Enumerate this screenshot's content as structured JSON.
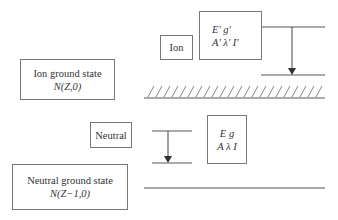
{
  "diagram": {
    "ion_ground_box": {
      "line1": "Ion ground state",
      "line2": "N(Z,0)"
    },
    "ion_box": {
      "label": "Ion"
    },
    "ion_level_box": {
      "line1": "E′ g′",
      "line2": "A′ λ′ I′"
    },
    "neutral_box": {
      "label": "Neutral"
    },
    "neutral_level_box": {
      "line1": "E  g",
      "line2": "A λ I"
    },
    "neutral_ground_box": {
      "line1": "Neutral ground state",
      "line2": "N(Z−1,0)"
    },
    "colors": {
      "line": "#555555",
      "box_border": "#777777",
      "text": "#333333"
    }
  }
}
